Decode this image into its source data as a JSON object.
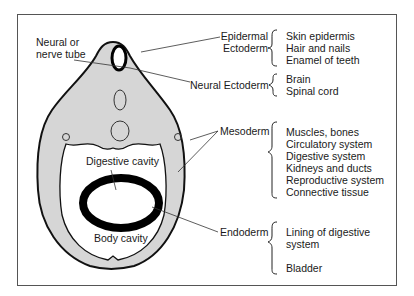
{
  "figure": {
    "labels": {
      "neural_tube": [
        "Neural or",
        "nerve tube"
      ],
      "epidermal_ectoderm": [
        "Epidermal",
        "Ectoderm"
      ],
      "neural_ectoderm": "Neural Ectoderm",
      "mesoderm": "Mesoderm",
      "endoderm": "Endoderm",
      "digestive_cavity": "Digestive cavity",
      "body_cavity": "Body cavity"
    },
    "derivatives": {
      "epidermal_ectoderm": [
        "Skin epidermis",
        "Hair and nails",
        "Enamel of teeth"
      ],
      "neural_ectoderm": [
        "Brain",
        "Spinal cord"
      ],
      "mesoderm": [
        "Muscles, bones",
        "Circulatory system",
        "Digestive system",
        "Kidneys and ducts",
        "Reproductive system",
        "Connective tissue"
      ],
      "endoderm": [
        "Lining of digestive",
        "system",
        "",
        "Bladder"
      ]
    },
    "colors": {
      "tissue_fill": "#d6d6d6",
      "outline": "#111111",
      "endoderm_ring": "#000000",
      "frame": "#555555"
    }
  }
}
